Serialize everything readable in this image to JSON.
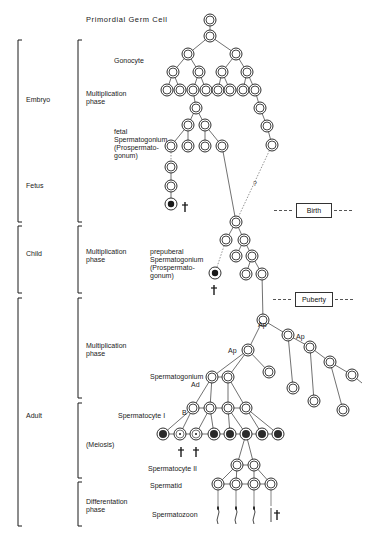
{
  "title": "Primordial Germ Cell",
  "age_periods": [
    {
      "label": "Embryo",
      "x": 26,
      "y": 96
    },
    {
      "label": "Fetus",
      "x": 26,
      "y": 182
    },
    {
      "label": "Child",
      "x": 26,
      "y": 250
    },
    {
      "label": "Adult",
      "x": 26,
      "y": 412
    }
  ],
  "phases": [
    {
      "label": "Multiplication\nphase",
      "x": 86,
      "y": 90
    },
    {
      "label": "Multiplication\nphase",
      "x": 86,
      "y": 248
    },
    {
      "label": "Multiplication\nphase",
      "x": 86,
      "y": 342
    },
    {
      "label": "(Meiosis)",
      "x": 86,
      "y": 441
    },
    {
      "label": "Differentation\nphase",
      "x": 86,
      "y": 498
    }
  ],
  "cell_labels": [
    {
      "label": "Gonocyte",
      "x": 114,
      "y": 57
    },
    {
      "label": "fetal\nSpermatogonium\n(Prospermato-\ngonum)",
      "x": 114,
      "y": 128
    },
    {
      "label": "prepuberal\nSpermatogonium\n(Prospermato-\ngonum)",
      "x": 150,
      "y": 248
    },
    {
      "label": "Ap",
      "x": 258,
      "y": 321
    },
    {
      "label": "Ap",
      "x": 296,
      "y": 333
    },
    {
      "label": "Ap",
      "x": 228,
      "y": 347
    },
    {
      "label": "Spermatogonium",
      "x": 150,
      "y": 373
    },
    {
      "label": "Ad",
      "x": 191,
      "y": 381
    },
    {
      "label": "B",
      "x": 182,
      "y": 409
    },
    {
      "label": "Spermatocyte I",
      "x": 118,
      "y": 412
    },
    {
      "label": "Spermatocyte II",
      "x": 148,
      "y": 465
    },
    {
      "label": "Spermatid",
      "x": 150,
      "y": 482
    },
    {
      "label": "Spermatozoon",
      "x": 152,
      "y": 511
    },
    {
      "label": "?",
      "x": 253,
      "y": 180
    }
  ],
  "events": [
    {
      "label": "Birth",
      "x": 296,
      "y": 203,
      "w": 34
    },
    {
      "label": "Puberty",
      "x": 295,
      "y": 292,
      "w": 36
    }
  ],
  "brackets": {
    "outer": [
      {
        "y1": 40,
        "y2": 222
      },
      {
        "y1": 226,
        "y2": 293
      },
      {
        "y1": 298,
        "y2": 526
      }
    ],
    "inner": [
      {
        "y1": 40,
        "y2": 222
      },
      {
        "y1": 226,
        "y2": 293
      },
      {
        "y1": 298,
        "y2": 398
      },
      {
        "y1": 403,
        "y2": 478
      },
      {
        "y1": 482,
        "y2": 526
      }
    ]
  },
  "nodes": {
    "pgc": [
      [
        210,
        20
      ]
    ],
    "gonocytes": [
      [
        210,
        36
      ],
      [
        188,
        54
      ],
      [
        236,
        54
      ],
      [
        173,
        72
      ],
      [
        199,
        72
      ],
      [
        222,
        72
      ],
      [
        247,
        72
      ],
      [
        167,
        90
      ],
      [
        180,
        90
      ],
      [
        193,
        90
      ],
      [
        206,
        90
      ],
      [
        218,
        90
      ],
      [
        230,
        90
      ],
      [
        243,
        90
      ],
      [
        255,
        90
      ]
    ],
    "fetal": [
      [
        196,
        108
      ],
      [
        188,
        125
      ],
      [
        205,
        125
      ],
      [
        171,
        146
      ],
      [
        188,
        146
      ],
      [
        205,
        146
      ],
      [
        222,
        146
      ],
      [
        171,
        167
      ],
      [
        171,
        186
      ]
    ],
    "fetal_right": [
      [
        260,
        108
      ],
      [
        267,
        126
      ],
      [
        272,
        145
      ]
    ],
    "fetal_dead": [
      [
        171,
        204
      ]
    ],
    "prepuberal": [
      [
        236,
        222
      ],
      [
        226,
        240
      ],
      [
        244,
        240
      ],
      [
        236,
        256
      ],
      [
        252,
        256
      ],
      [
        246,
        274
      ],
      [
        262,
        274
      ]
    ],
    "prepuberal_dead": [
      [
        215,
        273
      ]
    ],
    "ap": [
      [
        263,
        320
      ],
      [
        288,
        335
      ],
      [
        248,
        350
      ]
    ],
    "ap_chain": [
      [
        310,
        347
      ],
      [
        330,
        362
      ],
      [
        352,
        375
      ]
    ],
    "ap_leaves": [
      [
        269,
        372
      ],
      [
        293,
        388
      ],
      [
        314,
        401
      ],
      [
        343,
        410
      ]
    ],
    "ad": [
      [
        212,
        377
      ],
      [
        228,
        377
      ]
    ],
    "b": [
      [
        193,
        408
      ],
      [
        210,
        408
      ],
      [
        228,
        408
      ],
      [
        246,
        408
      ]
    ],
    "sc1_dead": [
      [
        180,
        434
      ],
      [
        196,
        434
      ]
    ],
    "sc1": [
      [
        163,
        434
      ],
      [
        214,
        434
      ],
      [
        230,
        434
      ],
      [
        246,
        434
      ],
      [
        262,
        434
      ],
      [
        278,
        434
      ]
    ],
    "sc2": [
      [
        237,
        465
      ],
      [
        254,
        465
      ]
    ],
    "spermatids": [
      [
        218,
        484
      ],
      [
        236,
        484
      ],
      [
        254,
        484
      ],
      [
        271,
        484
      ]
    ]
  },
  "death_marks": [
    [
      185,
      207
    ],
    [
      214,
      290
    ],
    [
      181,
      452
    ],
    [
      196,
      452
    ],
    [
      277,
      515
    ]
  ],
  "colors": {
    "ink": "#1a1a1a",
    "line": "#333333",
    "dotted": "#777777",
    "dark_cell": "#2a2a2a"
  }
}
